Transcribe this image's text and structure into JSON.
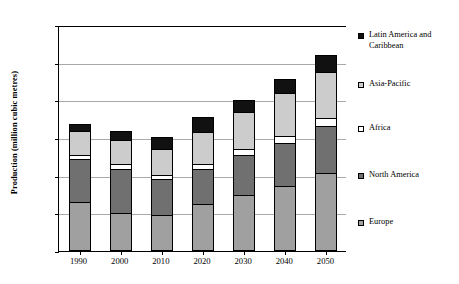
{
  "chart_data": {
    "type": "bar",
    "subtype": "stacked-vertical",
    "title": "",
    "xlabel": "",
    "ylabel": "Production (million cubic metres)",
    "categories": [
      "1990",
      "2000",
      "2010",
      "2020",
      "2030",
      "2040",
      "2050"
    ],
    "ylim": [
      0,
      3000
    ],
    "ytick_values": [
      0,
      500,
      1000,
      1500,
      2000,
      2500,
      3000
    ],
    "ytick_labels": [
      "0",
      "500",
      "1,000",
      "1,500",
      "2,000",
      "2,500",
      "3,000"
    ],
    "grid": true,
    "grid_axis": "y",
    "legend_position": "right",
    "stack_order_bottom_to_top": [
      "Europe",
      "North America",
      "Africa",
      "Asia-Pacific",
      "Latin America and Caribbean"
    ],
    "series": [
      {
        "name": "Europe",
        "color": "#a0a0a0",
        "values": [
          650,
          500,
          480,
          620,
          740,
          860,
          1030
        ]
      },
      {
        "name": "North America",
        "color": "#707070",
        "values": [
          570,
          590,
          470,
          470,
          530,
          580,
          630
        ]
      },
      {
        "name": "Africa",
        "color": "#ffffff",
        "values": [
          50,
          60,
          60,
          70,
          80,
          90,
          100
        ]
      },
      {
        "name": "Asia-Pacific",
        "color": "#cccccc",
        "values": [
          320,
          330,
          340,
          420,
          490,
          570,
          620
        ]
      },
      {
        "name": "Latin America and Caribbean",
        "color": "#111111",
        "values": [
          90,
          120,
          170,
          200,
          170,
          180,
          220
        ]
      }
    ],
    "totals": [
      1680,
      1600,
      1520,
      1780,
      2010,
      2280,
      2600
    ],
    "legend_entries": [
      "Latin America and\nCaribbean",
      "Asia-Pacific",
      "Africa",
      "North America",
      "Europe"
    ]
  }
}
